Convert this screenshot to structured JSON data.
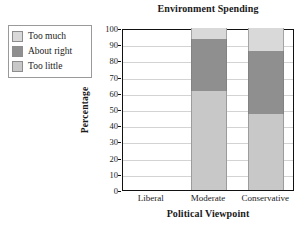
{
  "chart_data": {
    "type": "bar",
    "subtype": "stacked-bar-100",
    "title": "Environment Spending",
    "xlabel": "Political Viewpoint",
    "ylabel": "Percentage",
    "categories": [
      "Liberal",
      "Moderate",
      "Conservative"
    ],
    "series": [
      {
        "name": "Too little",
        "values": [
          null,
          61,
          47
        ],
        "color": "#c8c8c8"
      },
      {
        "name": "About right",
        "values": [
          null,
          32,
          39
        ],
        "color": "#8f8f8f"
      },
      {
        "name": "Too much",
        "values": [
          null,
          7,
          14
        ],
        "color": "#d9d9d9"
      }
    ],
    "stack_order_bottom_to_top": [
      "Too little",
      "About right",
      "Too much"
    ],
    "ylim": [
      0,
      100
    ],
    "yticks": [
      0,
      10,
      20,
      30,
      40,
      50,
      60,
      70,
      80,
      90,
      100
    ],
    "ytick_labels": [
      "0",
      "10",
      "20",
      "30",
      "40",
      "50",
      "60",
      "70",
      "80",
      "90",
      "100"
    ],
    "grid": "horizontal",
    "legend_position": "outside-top-left"
  },
  "legend": {
    "items": [
      {
        "label": "Too much",
        "swatch": "#d9d9d9"
      },
      {
        "label": "About right",
        "swatch": "#8f8f8f"
      },
      {
        "label": "Too little",
        "swatch": "#c8c8c8"
      }
    ]
  },
  "colors": {
    "axis": "#111111",
    "grid": "#d3d3d3",
    "text": "#1a1a1a",
    "plot_background": "#ffffff",
    "too_much": "#d9d9d9",
    "about_right": "#8f8f8f",
    "too_little": "#c8c8c8"
  }
}
